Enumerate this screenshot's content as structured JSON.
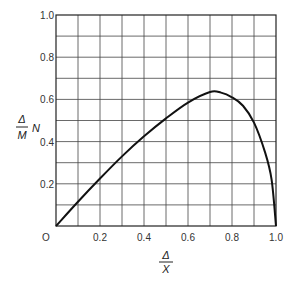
{
  "chart_data": {
    "type": "line",
    "title": "",
    "xlabel": "Δ/X",
    "ylabel": "(Δ/M) N",
    "xlim": [
      0,
      1.0
    ],
    "ylim": [
      0,
      1.0
    ],
    "grid": true,
    "grid_x_step": 0.1,
    "grid_y_step": 0.1,
    "x_ticks": [
      "O",
      "0.2",
      "0.4",
      "0.6",
      "0.8",
      "1.0"
    ],
    "y_ticks": [
      "0.2",
      "0.4",
      "0.6",
      "0.8",
      "1.0"
    ],
    "series": [
      {
        "name": "curve",
        "x": [
          0,
          0.1,
          0.2,
          0.3,
          0.4,
          0.5,
          0.6,
          0.7,
          0.75,
          0.8,
          0.85,
          0.9,
          0.95,
          0.98,
          1.0
        ],
        "y": [
          0,
          0.115,
          0.225,
          0.33,
          0.425,
          0.51,
          0.585,
          0.635,
          0.632,
          0.61,
          0.57,
          0.49,
          0.35,
          0.22,
          0.0
        ]
      }
    ]
  },
  "labels": {
    "x_axis_num": "Δ",
    "x_axis_den": "X",
    "y_axis_num": "Δ",
    "y_axis_den": "M",
    "y_axis_suffix": "N",
    "origin": "O"
  }
}
